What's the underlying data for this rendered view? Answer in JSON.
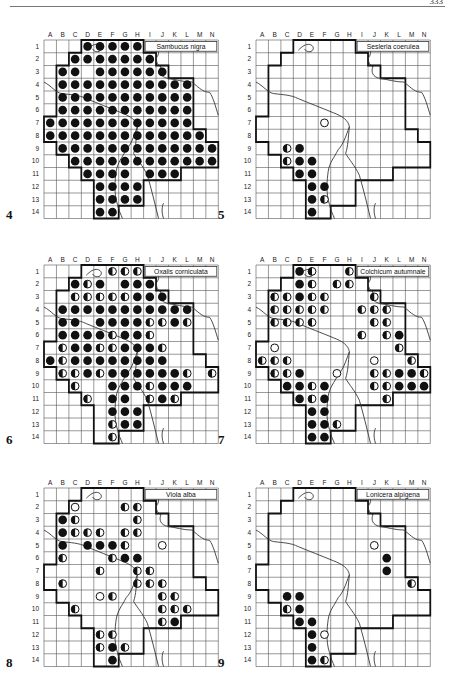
{
  "page": {
    "page_number": "333"
  },
  "grid": {
    "columns": [
      "A",
      "B",
      "C",
      "D",
      "E",
      "F",
      "G",
      "H",
      "I",
      "J",
      "K",
      "L",
      "M",
      "N"
    ],
    "rows": [
      "1",
      "2",
      "3",
      "4",
      "5",
      "6",
      "7",
      "8",
      "9",
      "10",
      "11",
      "12",
      "13",
      "14"
    ]
  },
  "legend": {
    "F": "filled-circle",
    "H": "half-filled-circle",
    "O": "open-circle"
  },
  "maps": [
    {
      "id": "4",
      "number": "4",
      "title": "Sambucus nigra",
      "cells": {
        "1": {
          "D": "F",
          "E": "F",
          "F": "F",
          "G": "F",
          "H": "F"
        },
        "2": {
          "C": "F",
          "D": "F",
          "E": "F",
          "F": "F",
          "G": "F",
          "H": "F",
          "I": "F"
        },
        "3": {
          "B": "F",
          "C": "F",
          "E": "F",
          "F": "F",
          "G": "F",
          "H": "F",
          "I": "F",
          "J": "F"
        },
        "4": {
          "B": "F",
          "C": "F",
          "D": "F",
          "E": "F",
          "F": "F",
          "G": "F",
          "H": "F",
          "I": "F",
          "J": "F",
          "K": "F",
          "L": "F"
        },
        "5": {
          "B": "F",
          "C": "F",
          "D": "F",
          "E": "F",
          "F": "F",
          "G": "F",
          "H": "F",
          "I": "F",
          "J": "F",
          "K": "F",
          "L": "F"
        },
        "6": {
          "B": "F",
          "C": "F",
          "D": "F",
          "E": "F",
          "F": "F",
          "G": "F",
          "H": "F",
          "I": "F",
          "J": "F",
          "K": "F",
          "L": "F"
        },
        "7": {
          "A": "F",
          "B": "F",
          "C": "F",
          "D": "F",
          "E": "F",
          "F": "F",
          "G": "F",
          "H": "F",
          "I": "F",
          "J": "F",
          "K": "F",
          "L": "F"
        },
        "8": {
          "A": "F",
          "B": "F",
          "C": "F",
          "D": "F",
          "E": "F",
          "F": "F",
          "G": "F",
          "H": "F",
          "I": "F",
          "J": "F",
          "K": "F",
          "L": "F",
          "M": "F"
        },
        "9": {
          "B": "F",
          "C": "F",
          "D": "F",
          "E": "F",
          "F": "F",
          "G": "F",
          "H": "F",
          "I": "F",
          "J": "F",
          "K": "F",
          "L": "F",
          "M": "F",
          "N": "F"
        },
        "10": {
          "C": "F",
          "D": "F",
          "E": "F",
          "F": "F",
          "G": "F",
          "H": "F",
          "I": "F",
          "J": "F",
          "K": "F",
          "L": "F",
          "M": "F",
          "N": "F"
        },
        "11": {
          "D": "F",
          "E": "F",
          "F": "F",
          "G": "F",
          "I": "F",
          "J": "F",
          "K": "F"
        },
        "12": {
          "E": "F",
          "F": "F",
          "G": "F",
          "H": "F"
        },
        "13": {
          "E": "F",
          "F": "F",
          "G": "F",
          "H": "F"
        },
        "14": {
          "E": "F",
          "F": "F"
        }
      }
    },
    {
      "id": "5",
      "number": "5",
      "title": "Sesleria coerulea",
      "cells": {
        "7": {
          "F": "O"
        },
        "9": {
          "C": "H",
          "D": "F"
        },
        "10": {
          "C": "H",
          "D": "F",
          "E": "F"
        },
        "11": {
          "D": "F",
          "E": "F"
        },
        "12": {
          "E": "F",
          "F": "F"
        },
        "13": {
          "E": "F",
          "F": "H"
        },
        "14": {
          "E": "F"
        }
      }
    },
    {
      "id": "6",
      "number": "6",
      "title": "Oxalis corniculata",
      "cells": {
        "1": {
          "F": "H",
          "G": "H",
          "H": "H"
        },
        "2": {
          "C": "F",
          "D": "H",
          "E": "F",
          "G": "F",
          "H": "F",
          "I": "F"
        },
        "3": {
          "C": "H",
          "D": "H",
          "E": "H",
          "F": "H",
          "G": "H",
          "H": "F",
          "I": "F",
          "J": "F"
        },
        "4": {
          "B": "F",
          "C": "F",
          "D": "F",
          "E": "F",
          "F": "F",
          "G": "F",
          "H": "F",
          "I": "F",
          "J": "F",
          "K": "F",
          "L": "F"
        },
        "5": {
          "B": "F",
          "C": "F",
          "E": "F",
          "F": "F",
          "G": "F",
          "H": "F",
          "I": "H",
          "J": "H",
          "K": "F",
          "L": "H"
        },
        "6": {
          "B": "F",
          "C": "F",
          "D": "F",
          "E": "F",
          "F": "H",
          "G": "F",
          "H": "F",
          "I": "H"
        },
        "7": {
          "B": "H",
          "C": "F",
          "D": "F",
          "E": "H",
          "F": "H",
          "G": "F",
          "H": "F",
          "I": "F",
          "J": "H"
        },
        "8": {
          "A": "F",
          "B": "H",
          "C": "F",
          "D": "F",
          "E": "F",
          "F": "F",
          "G": "F",
          "H": "F",
          "I": "F",
          "J": "F"
        },
        "9": {
          "B": "H",
          "C": "H",
          "D": "F",
          "E": "H",
          "F": "F",
          "G": "F",
          "H": "F",
          "I": "F",
          "J": "F",
          "K": "F",
          "L": "H",
          "N": "H"
        },
        "10": {
          "C": "H",
          "F": "F",
          "G": "F",
          "H": "F",
          "I": "H",
          "J": "F",
          "K": "F",
          "L": "F"
        },
        "11": {
          "D": "H",
          "F": "F",
          "G": "F",
          "I": "H",
          "J": "F",
          "K": "H"
        },
        "12": {
          "F": "F",
          "G": "F",
          "H": "F"
        },
        "13": {
          "F": "H",
          "G": "F",
          "H": "F"
        },
        "14": {
          "F": "H"
        }
      }
    },
    {
      "id": "7",
      "number": "7",
      "title": "Colchicum autumnale",
      "cells": {
        "1": {
          "D": "F",
          "E": "H",
          "H": "H"
        },
        "2": {
          "D": "F",
          "E": "H",
          "G": "H",
          "H": "H"
        },
        "3": {
          "B": "H",
          "C": "H",
          "D": "F",
          "E": "H",
          "F": "H",
          "J": "H"
        },
        "4": {
          "B": "H",
          "C": "H",
          "D": "H",
          "E": "H",
          "F": "H",
          "I": "H",
          "J": "H",
          "K": "H"
        },
        "5": {
          "B": "H",
          "C": "H",
          "D": "H",
          "E": "H",
          "J": "H",
          "K": "H"
        },
        "6": {
          "I": "H",
          "K": "H",
          "L": "F"
        },
        "7": {
          "B": "O",
          "L": "H"
        },
        "8": {
          "A": "H",
          "B": "H",
          "C": "H",
          "J": "O",
          "M": "H"
        },
        "9": {
          "B": "H",
          "C": "H",
          "D": "F",
          "G": "O",
          "J": "H",
          "K": "H",
          "L": "F",
          "M": "F",
          "N": "H"
        },
        "10": {
          "C": "F",
          "D": "F",
          "E": "H",
          "F": "F",
          "J": "H",
          "K": "H",
          "L": "F",
          "M": "F",
          "N": "F"
        },
        "11": {
          "D": "F",
          "E": "H",
          "F": "F",
          "K": "H"
        },
        "12": {
          "E": "F",
          "F": "F"
        },
        "13": {
          "E": "F",
          "F": "F",
          "G": "H"
        },
        "14": {
          "E": "F",
          "F": "F"
        }
      }
    },
    {
      "id": "8",
      "number": "8",
      "title": "Viola alba",
      "cells": {
        "2": {
          "C": "O",
          "G": "H",
          "H": "H"
        },
        "3": {
          "B": "F",
          "C": "H",
          "H": "H"
        },
        "4": {
          "B": "F",
          "C": "H",
          "D": "H",
          "E": "H",
          "G": "H",
          "H": "H"
        },
        "5": {
          "B": "F",
          "D": "F",
          "E": "F",
          "F": "F",
          "G": "H",
          "J": "O"
        },
        "6": {
          "B": "H",
          "F": "H",
          "G": "F",
          "H": "F"
        },
        "7": {
          "E": "H",
          "H": "H",
          "I": "H"
        },
        "8": {
          "B": "H",
          "H": "H",
          "I": "H",
          "J": "H"
        },
        "9": {
          "E": "O",
          "F": "H",
          "J": "H",
          "K": "H"
        },
        "10": {
          "C": "H",
          "J": "H",
          "K": "H",
          "L": "H"
        },
        "11": {
          "J": "H",
          "K": "F"
        },
        "12": {
          "E": "H",
          "F": "H"
        },
        "13": {
          "E": "H",
          "F": "F",
          "G": "H"
        },
        "14": {
          "F": "F"
        }
      }
    },
    {
      "id": "9",
      "number": "9",
      "title": "Lonicera alpigena",
      "cells": {
        "5": {
          "J": "O"
        },
        "6": {
          "K": "F"
        },
        "7": {
          "K": "F"
        },
        "8": {
          "M": "H"
        },
        "9": {
          "C": "F",
          "D": "F"
        },
        "10": {
          "C": "H",
          "D": "F"
        },
        "11": {
          "D": "F",
          "E": "F"
        },
        "12": {
          "E": "F",
          "F": "O"
        },
        "13": {
          "E": "F"
        },
        "14": {
          "E": "F",
          "F": "H"
        }
      }
    }
  ]
}
